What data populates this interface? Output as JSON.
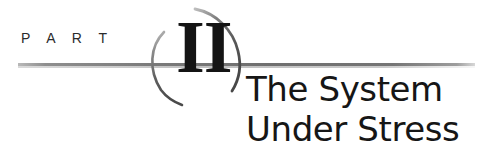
{
  "page": {
    "kind": "book-part-opener",
    "background_color": "#ffffff",
    "ink_color": "#161616",
    "rule_color": "#6f6f6f",
    "arc_color": "#555555"
  },
  "opener": {
    "kicker": "P A R T",
    "numeral": "II",
    "numeral_value": "2",
    "title_lines": [
      "The System",
      "Under Stress"
    ],
    "full_title": "The System Under Stress"
  },
  "ornament": {
    "left_arc_name": "left-swash-arc",
    "right_arc_name": "right-swash-arc",
    "rule_name": "horizontal-rule"
  }
}
